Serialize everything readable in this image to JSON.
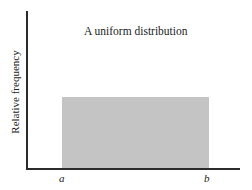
{
  "chart_data": {
    "type": "area",
    "title": "A uniform distribution",
    "xlabel": "",
    "ylabel": "Relative frequency",
    "tick_labels": [
      "a",
      "b"
    ],
    "x": [
      "a",
      "b"
    ],
    "series": [
      {
        "name": "uniform density",
        "values": [
          1,
          1
        ]
      }
    ],
    "grid": false,
    "legend": "none",
    "fill_color": "#c4c4c4"
  }
}
